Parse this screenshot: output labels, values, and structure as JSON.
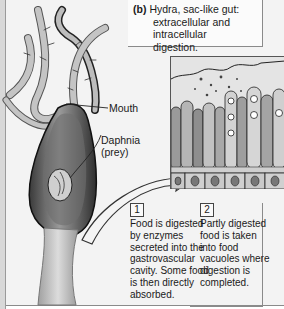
{
  "figure": {
    "panel_label": "(b)",
    "caption": "Hydra, sac-like gut: extracellular and intracellular digestion.",
    "caption_lines": [
      "Hydra, sac-like gut:",
      "extracellular and intracellular",
      "digestion."
    ]
  },
  "labels": {
    "mouth": "Mouth",
    "daphnia_line1": "Daphnia",
    "daphnia_line2": "(prey)"
  },
  "steps": [
    {
      "number": "1",
      "lines": [
        "Food is digested",
        "by enzymes",
        "secreted into the",
        "gastrovascular",
        "cavity. Some food",
        "is then directly",
        "absorbed."
      ]
    },
    {
      "number": "2",
      "lines": [
        "Partly digested",
        "food is taken",
        "into food",
        "vacuoles where",
        "digestion is",
        "completed."
      ]
    }
  ],
  "colors": {
    "background": "#f3f3f3",
    "ink": "#1a1a1a",
    "body_dark": "#2a2a2a",
    "body_mid": "#8c8c8c",
    "tentacle": "#b9b9b9",
    "inset_bg": "#d9d9d9"
  }
}
